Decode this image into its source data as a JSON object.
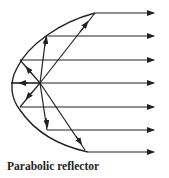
{
  "caption": "Parabolic reflector",
  "colors": {
    "stroke": "#222222",
    "background": "#ffffff"
  },
  "diagram": {
    "focus": [
      40,
      83
    ],
    "parabola_points": [
      [
        95,
        13
      ],
      [
        48,
        36
      ],
      [
        20,
        60
      ],
      [
        11,
        83
      ],
      [
        20,
        107
      ],
      [
        48,
        130
      ],
      [
        88,
        152
      ]
    ],
    "reflected_rays_y": [
      13,
      36,
      60,
      83,
      107,
      130,
      152
    ],
    "ray_end_x": 154
  }
}
